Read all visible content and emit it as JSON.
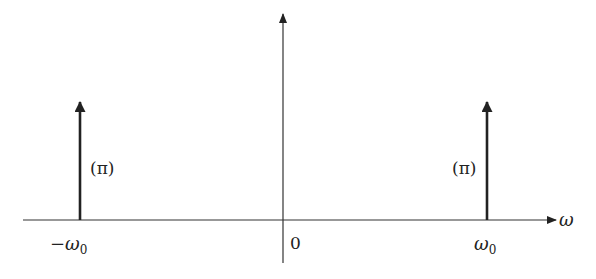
{
  "diagram": {
    "axes": {
      "horizontal_label": "ω",
      "origin_label": "0"
    },
    "impulses": [
      {
        "position_label": "−ω",
        "subscript": "0",
        "weight_label": "(π)"
      },
      {
        "position_label": "ω",
        "subscript": "0",
        "weight_label": "(π)"
      }
    ],
    "colors": {
      "stroke": "#222222",
      "background": "#ffffff"
    }
  }
}
